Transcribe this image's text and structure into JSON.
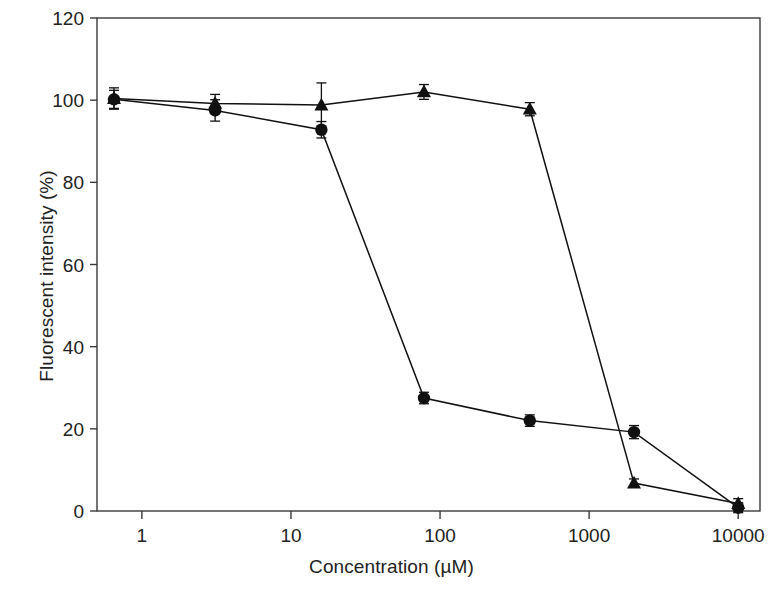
{
  "chart_data": {
    "type": "line",
    "title": "",
    "xlabel": "Concentration (µM)",
    "ylabel": "Fluorescent intensity (%)",
    "xscale": "log",
    "xlim": [
      0.5,
      14000
    ],
    "ylim": [
      0,
      120
    ],
    "xticks": [
      1,
      10,
      100,
      1000,
      10000
    ],
    "xticklabels": [
      "1",
      "10",
      "100",
      "1000",
      "10000"
    ],
    "yticks": [
      0,
      20,
      40,
      60,
      80,
      100,
      120
    ],
    "yticklabels": [
      "0",
      "20",
      "40",
      "60",
      "80",
      "100",
      "120"
    ],
    "grid": false,
    "legend": "none",
    "color": "#111111",
    "series": [
      {
        "name": "circle-series",
        "marker": "circle",
        "x": [
          0.65,
          3.1,
          16,
          78,
          400,
          2000,
          10000
        ],
        "y": [
          100.2,
          97.5,
          92.8,
          27.5,
          22.0,
          19.2,
          0.8
        ],
        "yerr": [
          2.2,
          2.6,
          2.0,
          1.4,
          1.4,
          1.6,
          1.2
        ]
      },
      {
        "name": "triangle-series",
        "marker": "triangle",
        "x": [
          0.65,
          3.1,
          16,
          78,
          400,
          2000,
          10000
        ],
        "y": [
          100.4,
          99.2,
          98.8,
          102.0,
          97.8,
          6.8,
          1.8
        ],
        "yerr": [
          2.6,
          2.2,
          5.4,
          1.8,
          1.6,
          1.0,
          1.2
        ]
      }
    ]
  }
}
